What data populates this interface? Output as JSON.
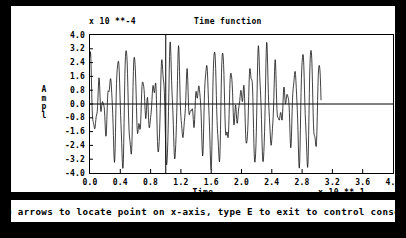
{
  "window": {
    "background_color": "#000000",
    "panel_color": "#ffffff",
    "foreground_color": "#000000"
  },
  "plot": {
    "title": "Time function",
    "y_exponent_label": "x 10 **-4",
    "x_exponent_label": "x 10 **-1",
    "y_axis_name_chars": [
      "A",
      "m",
      "p",
      "l"
    ],
    "x_axis_name": "Time"
  },
  "statusbar": {
    "message": "Use arrows to locate point on x-axis, type E to exit to control console"
  },
  "caption": {
    "artifact": ""
  },
  "chart_data": {
    "type": "line",
    "title": "Time function",
    "xlabel": "Time",
    "ylabel": "Ampl",
    "x_scale_label": "x 10 **-1",
    "y_scale_label": "x 10 **-4",
    "xlim": [
      0.0,
      4.0
    ],
    "ylim": [
      -4.0,
      4.0
    ],
    "grid": false,
    "legend": null,
    "xticks": [
      "0.0",
      "0.4",
      "0.8",
      "1.2",
      "1.6",
      "2.0",
      "2.4",
      "2.8",
      "3.2",
      "3.6",
      "4.0"
    ],
    "xtick_values": [
      0.0,
      0.4,
      0.8,
      1.2,
      1.6,
      2.0,
      2.4,
      2.8,
      3.2,
      3.6,
      4.0
    ],
    "yticks": [
      "4.0",
      "3.2",
      "2.4",
      "1.6",
      "0.8",
      "0.0",
      "-0.8",
      "-1.6",
      "-2.4",
      "-3.2",
      "-4.0"
    ],
    "ytick_values": [
      4.0,
      3.2,
      2.4,
      1.6,
      0.8,
      0.0,
      -0.8,
      -1.6,
      -2.4,
      -3.2,
      -4.0
    ],
    "zero_line": 0.0,
    "cursor_x": 1.0,
    "data_x_start": 0.0,
    "data_x_end": 3.05,
    "waveform": {
      "description": "beating waveform: sum of two close sinusoids, amplitude envelope modulated",
      "carrier_cycles_per_unit": 8.6,
      "beat_period": 0.3,
      "peak_max": 3.6,
      "peak_min": -3.8,
      "samples_per_unit": 220
    },
    "series": [
      {
        "name": "amplitude",
        "peaks": [
          3.45,
          2.95,
          3.5,
          2.75,
          3.3,
          2.85,
          3.45,
          2.6,
          3.2,
          3.55,
          2.9,
          3.1,
          2.55,
          3.45,
          2.85,
          3.2,
          2.7,
          3.55,
          2.95,
          3.3,
          2.6,
          3.4,
          2.5
        ],
        "troughs": [
          -3.6,
          -1.1,
          -3.7,
          -1.0,
          -3.65,
          -0.95,
          -3.75,
          -1.2,
          -3.55,
          -3.7,
          -1.0,
          -3.6,
          -1.1,
          -3.75,
          -0.9,
          -3.6,
          -1.05,
          -3.8,
          -1.0,
          -3.65,
          -1.15,
          -3.7,
          -3.4
        ]
      }
    ]
  }
}
